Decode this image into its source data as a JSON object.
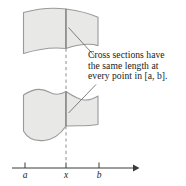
{
  "figure": {
    "title_text": "Cross sections have the same length at every point in [a, b].",
    "annotation": {
      "lines": [
        "Cross sections have",
        "the same length at",
        "every point in [a, b]."
      ]
    },
    "axis": {
      "ticks": [
        {
          "label": "a",
          "x": 25
        },
        {
          "label": "x",
          "x": 66
        },
        {
          "label": "b",
          "x": 99
        }
      ],
      "arrow_label": "arrow-right",
      "line_start_x": 12,
      "line_end_x": 137,
      "line_y": 168
    },
    "regions": [
      {
        "name": "upper-region",
        "label": ""
      },
      {
        "name": "lower-region",
        "label": ""
      }
    ],
    "colors": {
      "fill": "#e8e8e6",
      "stroke": "#9a9a9a",
      "axis": "#3a3a3a",
      "text": "#1a1a1a",
      "dashed": "#9a9a9a"
    }
  }
}
